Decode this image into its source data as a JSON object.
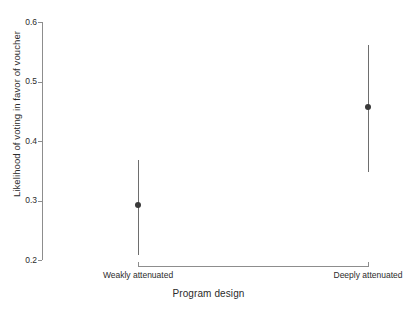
{
  "chart_data": {
    "type": "scatter",
    "title": "",
    "xlabel": "Program design",
    "ylabel": "Likelihood of voting in favor of voucher",
    "categories": [
      "Weakly attenuated",
      "Deeply attenuated"
    ],
    "values": [
      0.293,
      0.457
    ],
    "error_low": [
      0.208,
      0.348
    ],
    "error_high": [
      0.368,
      0.561
    ],
    "ylim": [
      0.2,
      0.6
    ],
    "ytick_labels": [
      "0.6",
      "0.5",
      "0.4",
      "0.3",
      "0.2"
    ],
    "ytick_values": [
      0.6,
      0.5,
      0.4,
      0.3,
      0.2
    ],
    "grid": false,
    "legend": "none",
    "series": [
      {
        "name": "Predicted likelihood",
        "points": [
          {
            "category": "Weakly attenuated",
            "estimate": 0.293,
            "ci_low": 0.208,
            "ci_high": 0.368
          },
          {
            "category": "Deeply attenuated",
            "estimate": 0.457,
            "ci_low": 0.348,
            "ci_high": 0.561
          }
        ]
      }
    ],
    "colors": {
      "point": "#3a3a3a",
      "errorbar": "#6e6e6e",
      "axis": "#8d8d8d",
      "text": "#2b2b2b",
      "background": "#ffffff"
    }
  },
  "axes": {
    "y": {
      "title": "Likelihood of voting in favor of voucher",
      "ticks": [
        {
          "label": "0.6"
        },
        {
          "label": "0.5"
        },
        {
          "label": "0.4"
        },
        {
          "label": "0.3"
        },
        {
          "label": "0.2"
        }
      ]
    },
    "x": {
      "title": "Program design",
      "ticks": [
        {
          "label": "Weakly attenuated"
        },
        {
          "label": "Deeply attenuated"
        }
      ]
    }
  }
}
